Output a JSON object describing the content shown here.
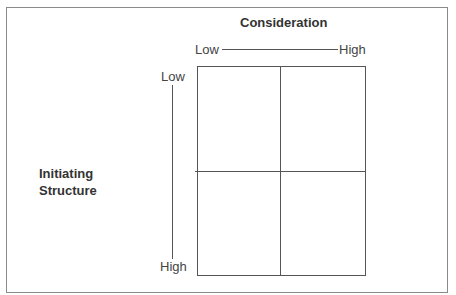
{
  "diagram": {
    "title": "Consideration",
    "x_axis": {
      "low_label": "Low",
      "high_label": "High"
    },
    "y_axis": {
      "low_label": "Low",
      "high_label": "High"
    },
    "side_label_line1": "Initiating",
    "side_label_line2": "Structure",
    "grid": {
      "rows": 2,
      "cols": 2,
      "cells": [
        "",
        "",
        "",
        ""
      ]
    },
    "colors": {
      "line": "#555555",
      "frame": "#8a8a8a",
      "text": "#3a3a3a"
    }
  }
}
